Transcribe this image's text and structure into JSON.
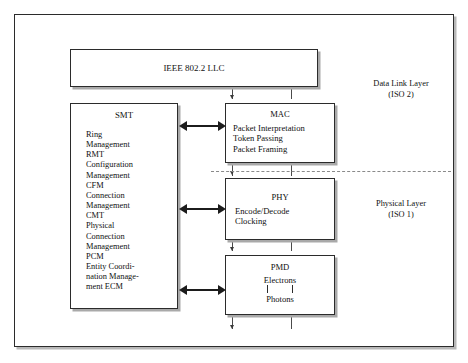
{
  "diagram": {
    "title_text": "",
    "boxes": {
      "llc": {
        "title": "IEEE 802.2 LLC"
      },
      "smt": {
        "title": "SMT",
        "lines": [
          "Ring",
          "Management",
          "RMT",
          "Configuration",
          "Management",
          "CFM",
          "Connection",
          "Management",
          "CMT",
          "Physical",
          "Connection",
          "Management",
          "PCM",
          "Entity Coordi-",
          "nation Manage-",
          "ment ECM"
        ]
      },
      "mac": {
        "title": "MAC",
        "lines": [
          "Packet Interpretation",
          "Token Passing",
          "Packet Framing"
        ]
      },
      "phy": {
        "title": "PHY",
        "lines": [
          "Encode/Decode",
          "Clocking"
        ]
      },
      "pmd": {
        "title": "PMD",
        "line_top": "Electrons",
        "line_bottom": "Photons"
      }
    },
    "layer_labels": {
      "data_link": {
        "line1": "Data Link Layer",
        "line2": "(ISO 2)"
      },
      "physical": {
        "line1": "Physical Layer",
        "line2": "(ISO 1)"
      }
    },
    "colors": {
      "frame_stroke": "#2b2b2b",
      "box_stroke": "#2b2b2b",
      "box_fill": "#ffffff",
      "shadow": "#a9a9a9",
      "arrow": "#1c1c1c",
      "divider": "#8a8a8a",
      "text": "#111111",
      "page_background": "#ffffff"
    }
  }
}
